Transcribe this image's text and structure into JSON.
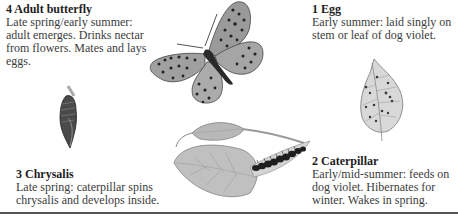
{
  "stages": [
    {
      "id": "adult",
      "title": "4 Adult butterfly",
      "text": "Late spring/early summer: adult emerges. Drinks nectar from flowers. Mates and lays eggs."
    },
    {
      "id": "egg",
      "title": "1 Egg",
      "text": "Early summer: laid singly on stem or leaf of dog violet."
    },
    {
      "id": "chrysalis",
      "title": "3 Chrysalis",
      "text": "Late spring: caterpillar spins chrysalis and develops inside."
    },
    {
      "id": "caterpillar",
      "title": "2 Caterpillar",
      "text": "Early/mid-summer: feeds on dog violet. Hibernates for winter. Wakes in spring."
    }
  ],
  "illustrations": {
    "butterfly": "spotted-fritillary-butterfly-illustration",
    "egg_leaf": "dog-violet-leaf-with-eggs-illustration",
    "chrysalis": "hanging-chrysalis-illustration",
    "caterpillar": "caterpillar-on-leaves-illustration"
  },
  "colors": {
    "text": "#3c3c3c",
    "title": "#1e1e1e",
    "rule": "#555555",
    "illustration_dark": "#2a2a2a",
    "illustration_mid": "#8a8a8a",
    "illustration_light": "#c8c8c8"
  }
}
